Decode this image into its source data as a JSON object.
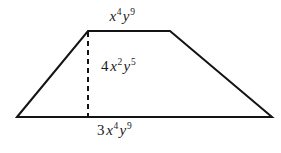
{
  "figure": {
    "type": "trapezoid-with-height",
    "background_color": "#ffffff",
    "stroke_color": "#141414",
    "text_color": "#1a1a1a",
    "outline_width": 2,
    "dash_width": 2,
    "dash_pattern": "5,4",
    "vertices": {
      "bottom_left": [
        17,
        117
      ],
      "top_left": [
        88,
        31
      ],
      "top_right": [
        170,
        31
      ],
      "bottom_right": [
        272,
        117
      ]
    },
    "height_segment": {
      "from": [
        88,
        31
      ],
      "to": [
        88,
        117
      ],
      "style": "dashed"
    }
  },
  "labels": {
    "top_side": {
      "name": "top-base-label",
      "text": "x4y9",
      "coefficient": "",
      "terms": [
        {
          "var": "x",
          "exp": "4"
        },
        {
          "var": "y",
          "exp": "9"
        }
      ]
    },
    "height": {
      "name": "height-label",
      "text": "4x2y5",
      "coefficient": "4",
      "terms": [
        {
          "var": "x",
          "exp": "2"
        },
        {
          "var": "y",
          "exp": "5"
        }
      ]
    },
    "bottom_side": {
      "name": "bottom-base-label",
      "text": "3x4y9",
      "coefficient": "3",
      "terms": [
        {
          "var": "x",
          "exp": "4"
        },
        {
          "var": "y",
          "exp": "9"
        }
      ]
    }
  }
}
